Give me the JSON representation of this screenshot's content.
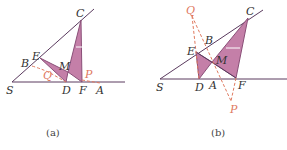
{
  "colors": {
    "line": "#5a3a5e",
    "fill": "#c47fa8",
    "fill_stroke": "#8a4f78",
    "dashed": "#e07a5f",
    "label": "#333333",
    "label_red": "#e07a5f"
  },
  "figures": [
    {
      "caption": "(a)",
      "labels": {
        "C": "C",
        "E": "E",
        "B": "B",
        "M": "M",
        "Q": "Q",
        "P": "P",
        "S": "S",
        "D": "D",
        "F": "F",
        "A": "A"
      }
    },
    {
      "caption": "(b)",
      "labels": {
        "Q": "Q",
        "C": "C",
        "B": "B",
        "E": "E",
        "M": "M",
        "S": "S",
        "D": "D",
        "A": "A",
        "F": "F",
        "P": "P"
      }
    }
  ]
}
